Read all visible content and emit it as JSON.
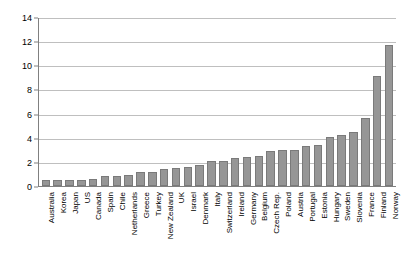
{
  "chart_data": {
    "type": "bar",
    "title": "",
    "subtitle": "",
    "xlabel": "",
    "ylabel": "",
    "ylim": [
      0,
      14
    ],
    "yticks": [
      0,
      2,
      4,
      6,
      8,
      10,
      12,
      14
    ],
    "grid": true,
    "legend": false,
    "legend_position": "none",
    "bar_color": "#969696",
    "bar_edge_color": "#7a7a7a",
    "gridline_color": "#bfbfbf",
    "axis_color": "#808080",
    "categories": [
      "Australia",
      "Korea",
      "Japan",
      "US",
      "Canada",
      "Spain",
      "Chile",
      "Netherlands",
      "Greece",
      "Turkey",
      "New Zealand",
      "UK",
      "Israel",
      "Denmark",
      "Italy",
      "Switzerland",
      "Ireland",
      "Germany",
      "Belgium",
      "Czech Rep.",
      "Poland",
      "Austria",
      "Portugal",
      "Estonia",
      "Hungary",
      "Sweden",
      "Slovenia",
      "France",
      "Finland",
      "Norway"
    ],
    "values": [
      0.5,
      0.5,
      0.5,
      0.5,
      0.6,
      0.8,
      0.8,
      0.9,
      1.2,
      1.2,
      1.4,
      1.5,
      1.6,
      1.7,
      2.1,
      2.1,
      2.3,
      2.4,
      2.5,
      2.9,
      3.0,
      3.0,
      3.3,
      3.4,
      4.1,
      4.2,
      4.5,
      5.6,
      9.1,
      11.7
    ]
  }
}
